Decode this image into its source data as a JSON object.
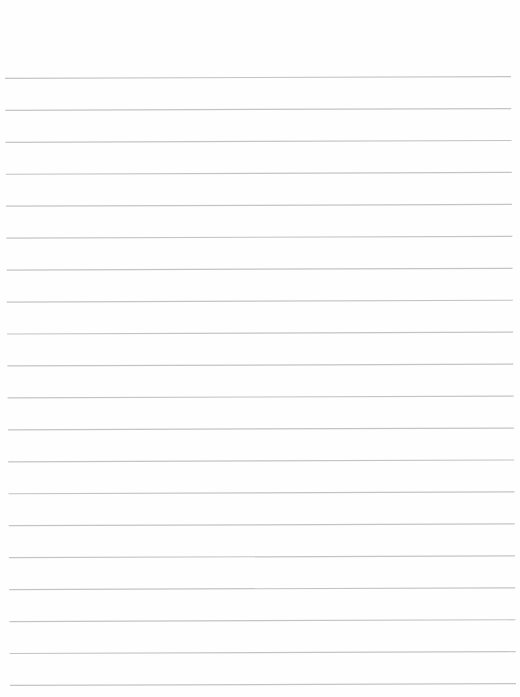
{
  "page": {
    "type": "lined-paper",
    "background": "#fefefe",
    "line_color": "#c4c4c4",
    "line_width": 1.2,
    "line_count": 20,
    "first_line_y": 77.5,
    "line_spacing": 31.95,
    "left_x_top": 5,
    "left_x_bottom": 10,
    "right_x_top": 511,
    "right_x_bottom": 516,
    "tilt_px": 1.8
  }
}
